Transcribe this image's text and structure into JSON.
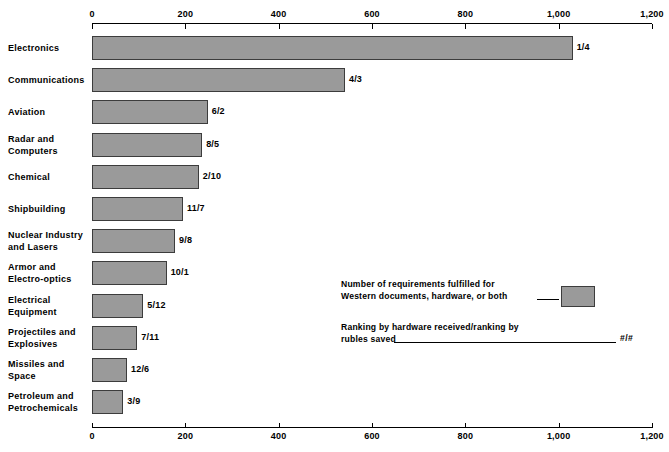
{
  "chart_data": {
    "type": "bar",
    "orientation": "horizontal",
    "title": "",
    "xlabel": "",
    "ylabel": "",
    "xlim": [
      0,
      1200
    ],
    "grid": false,
    "legend_position": "inside-right",
    "ticks": [
      {
        "value": 0,
        "label": "0"
      },
      {
        "value": 200,
        "label": "200"
      },
      {
        "value": 400,
        "label": "400"
      },
      {
        "value": 600,
        "label": "600"
      },
      {
        "value": 800,
        "label": "800"
      },
      {
        "value": 1000,
        "label": "1,000"
      },
      {
        "value": 1200,
        "label": "1,200"
      }
    ],
    "categories": [
      "Electronics",
      "Communications",
      "Aviation",
      "Radar and\nComputers",
      "Chemical",
      "Shipbuilding",
      "Nuclear Industry\nand Lasers",
      "Armor and\nElectro-optics",
      "Electrical\nEquipment",
      "Projectiles and\nExplosives",
      "Missiles and\nSpace",
      "Petroleum and\nPetrochemicals"
    ],
    "values": [
      1030,
      542,
      248,
      236,
      229,
      195,
      178,
      160,
      110,
      97,
      75,
      67
    ],
    "annotations": [
      "1/4",
      "4/3",
      "6/2",
      "8/5",
      "2/10",
      "11/7",
      "9/8",
      "10/1",
      "5/12",
      "7/11",
      "12/6",
      "3/9"
    ],
    "bar_color": "#9a9a9a",
    "bar_border_color": "#3c3c3c"
  },
  "legend": {
    "swatch_text": "Number of requirements fulfilled for\nWestern documents, hardware, or both",
    "ranking_text": "Ranking by hardware received/ranking by\nrubles saved",
    "ranking_mark": "#/#"
  }
}
